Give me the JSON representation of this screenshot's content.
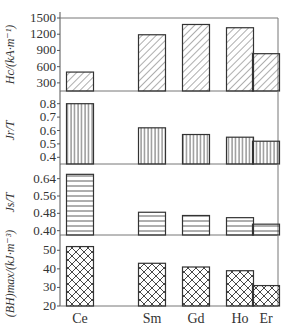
{
  "chart_data": [
    {
      "type": "bar",
      "ylabel": "H_c/(kA·m⁻¹)",
      "categories": [
        "Ce",
        "Sm",
        "Gd",
        "Ho",
        "Er"
      ],
      "values": [
        500,
        1190,
        1380,
        1320,
        840
      ],
      "ylim": [
        150,
        1500
      ],
      "yticks": [
        300,
        600,
        900,
        1200,
        1500
      ],
      "ytick_labels": [
        "300",
        "600",
        "900",
        "1200",
        "1500"
      ],
      "pattern": "diagonal"
    },
    {
      "type": "bar",
      "ylabel": "J_r/T",
      "categories": [
        "Ce",
        "Sm",
        "Gd",
        "Ho",
        "Er"
      ],
      "values": [
        0.8,
        0.62,
        0.57,
        0.55,
        0.52
      ],
      "ylim": [
        0.35,
        0.85
      ],
      "yticks": [
        0.4,
        0.5,
        0.6,
        0.7,
        0.8
      ],
      "ytick_labels": [
        "0.4",
        "0.5",
        "0.6",
        "0.7",
        "0.8"
      ],
      "pattern": "vertical"
    },
    {
      "type": "bar",
      "ylabel": "J_s/T",
      "categories": [
        "Ce",
        "Sm",
        "Gd",
        "Ho",
        "Er"
      ],
      "values": [
        0.66,
        0.485,
        0.47,
        0.46,
        0.43
      ],
      "ylim": [
        0.38,
        0.68
      ],
      "yticks": [
        0.4,
        0.48,
        0.56,
        0.64
      ],
      "ytick_labels": [
        "0.40",
        "0.48",
        "0.56",
        "0.64"
      ],
      "pattern": "horizontal"
    },
    {
      "type": "bar",
      "ylabel": "(BH)_max/(kJ·m⁻³)",
      "categories": [
        "Ce",
        "Sm",
        "Gd",
        "Ho",
        "Er"
      ],
      "values": [
        52,
        43,
        41,
        39,
        31
      ],
      "ylim": [
        20,
        55
      ],
      "yticks": [
        20,
        30,
        40,
        50
      ],
      "ytick_labels": [
        "20",
        "30",
        "40",
        "50"
      ],
      "pattern": "crosshatch"
    }
  ],
  "xaxis": {
    "labels": [
      "Ce",
      "Sm",
      "Gd",
      "Ho",
      "Er"
    ]
  }
}
